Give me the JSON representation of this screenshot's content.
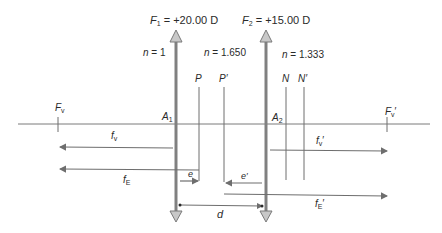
{
  "lenses": {
    "first": {
      "power_label": "F",
      "power_sub": "1",
      "power_value": " = +20.00 D",
      "vertex_label": "A",
      "vertex_sub": "1"
    },
    "second": {
      "power_label": "F",
      "power_sub": "2",
      "power_value": " = +15.00 D",
      "vertex_label": "A",
      "vertex_sub": "2"
    }
  },
  "media": {
    "left": {
      "n": "n",
      "value": " = 1"
    },
    "middle": {
      "n": "n",
      "value": " = 1.650"
    },
    "right": {
      "n": "n",
      "value": " = 1.333"
    }
  },
  "principal_planes": {
    "P": "P",
    "P_prime": "P′",
    "N": "N",
    "N_prime": "N′"
  },
  "focal_points": {
    "front": {
      "label": "F",
      "sub": "v"
    },
    "back": {
      "label": "F",
      "sub": "v",
      "prime": "′"
    }
  },
  "distances": {
    "fv": {
      "label": "f",
      "sub": "v"
    },
    "fv_prime": {
      "label": "f",
      "sub": "v",
      "prime": "′"
    },
    "fE": {
      "label": "f",
      "sub": "E"
    },
    "fE_prime": {
      "label": "f",
      "sub": "E",
      "prime": "′"
    },
    "e": "e",
    "e_prime": "e′",
    "d": "d"
  },
  "colors": {
    "line": "#6e6e6e",
    "lens": "#808080",
    "arrowhead_fill": "#c8c8c8",
    "text": "#2a2a2a"
  }
}
